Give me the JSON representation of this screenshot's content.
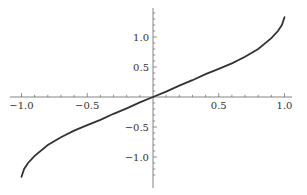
{
  "chart_data": {
    "type": "line",
    "title": "",
    "xlabel": "",
    "ylabel": "",
    "xlim": [
      -1.0,
      1.0
    ],
    "ylim": [
      -1.35,
      1.35
    ],
    "grid": false,
    "legend": null,
    "axes_style": "centered at origin",
    "x_ticks": [
      {
        "value": -1.0,
        "label": "-1.0"
      },
      {
        "value": -0.5,
        "label": "-0.5"
      },
      {
        "value": 0.5,
        "label": "0.5"
      },
      {
        "value": 1.0,
        "label": "1.0"
      }
    ],
    "y_ticks": [
      {
        "value": 1.0,
        "label": "1.0"
      },
      {
        "value": 0.5,
        "label": "0.5"
      },
      {
        "value": -0.5,
        "label": "-0.5"
      },
      {
        "value": -1.0,
        "label": "-1.0"
      }
    ],
    "series": [
      {
        "name": "curve",
        "color": "#333333",
        "x": [
          -1.0,
          -0.98,
          -0.95,
          -0.9,
          -0.8,
          -0.7,
          -0.6,
          -0.5,
          -0.4,
          -0.3,
          -0.2,
          -0.1,
          0.0,
          0.1,
          0.2,
          0.3,
          0.4,
          0.5,
          0.6,
          0.7,
          0.8,
          0.9,
          0.95,
          0.98,
          1.0
        ],
        "y": [
          -1.33,
          -1.2,
          -1.1,
          -0.98,
          -0.8,
          -0.67,
          -0.56,
          -0.47,
          -0.38,
          -0.28,
          -0.19,
          -0.09,
          0.0,
          0.09,
          0.19,
          0.28,
          0.38,
          0.47,
          0.56,
          0.67,
          0.8,
          0.98,
          1.1,
          1.2,
          1.33
        ]
      }
    ]
  }
}
